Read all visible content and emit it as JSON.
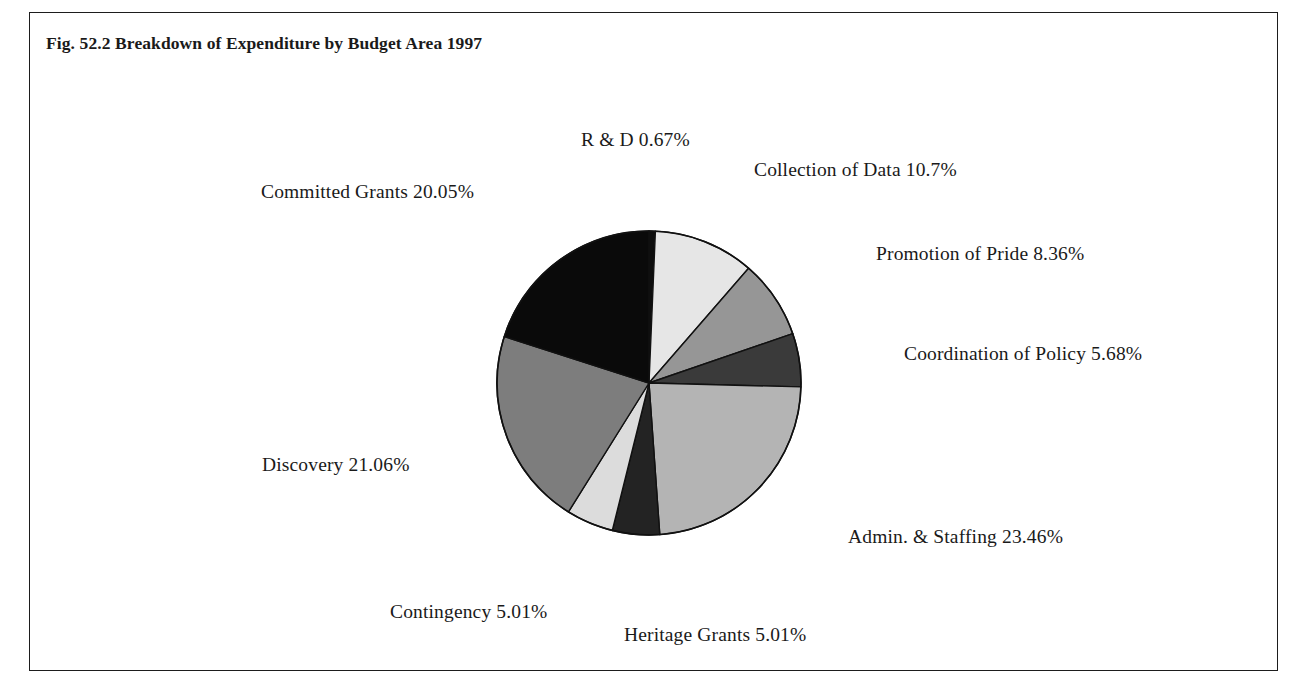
{
  "figure": {
    "title": "Fig. 52.2 Breakdown of Expenditure by Budget Area 1997"
  },
  "chart_data": {
    "type": "pie",
    "title": "Fig. 52.2 Breakdown of Expenditure by Budget Area 1997",
    "xlabel": "",
    "ylabel": "",
    "units": "percent",
    "start_angle_deg": 0,
    "direction": "clockwise",
    "legend": "none (direct slice labels)",
    "grid": false,
    "categories": [
      "R & D",
      "Collection of Data",
      "Promotion of Pride",
      "Coordination of Policy",
      "Admin. & Staffing",
      "Heritage Grants",
      "Contingency",
      "Discovery",
      "Committed Grants"
    ],
    "values": [
      0.67,
      10.7,
      8.36,
      5.68,
      23.46,
      5.01,
      5.01,
      21.06,
      20.05
    ],
    "colors": [
      "#0d0d0d",
      "#e6e6e6",
      "#969696",
      "#3a3a3a",
      "#b4b4b4",
      "#232323",
      "#dcdcdc",
      "#7d7d7d",
      "#0a0a0a"
    ],
    "slices": [
      {
        "label": "R & D",
        "value": 0.67,
        "text": "R & D 0.67%",
        "color": "#0d0d0d"
      },
      {
        "label": "Collection of Data",
        "value": 10.7,
        "text": "Collection of Data 10.7%",
        "color": "#e6e6e6"
      },
      {
        "label": "Promotion of Pride",
        "value": 8.36,
        "text": "Promotion of Pride 8.36%",
        "color": "#969696"
      },
      {
        "label": "Coordination of Policy",
        "value": 5.68,
        "text": "Coordination of Policy 5.68%",
        "color": "#3a3a3a"
      },
      {
        "label": "Admin. & Staffing",
        "value": 23.46,
        "text": "Admin. & Staffing 23.46%",
        "color": "#b4b4b4"
      },
      {
        "label": "Heritage Grants",
        "value": 5.01,
        "text": "Heritage Grants 5.01%",
        "color": "#232323"
      },
      {
        "label": "Contingency",
        "value": 5.01,
        "text": "Contingency 5.01%",
        "color": "#dcdcdc"
      },
      {
        "label": "Discovery",
        "value": 21.06,
        "text": "Discovery 21.06%",
        "color": "#7d7d7d"
      },
      {
        "label": "Committed Grants",
        "value": 20.05,
        "text": "Committed Grants 20.05%",
        "color": "#0a0a0a"
      }
    ]
  },
  "labels": {
    "rd": "R & D 0.67%",
    "collection": "Collection of Data 10.7%",
    "promotion": "Promotion of Pride 8.36%",
    "coordination": "Coordination of Policy 5.68%",
    "admin": "Admin. & Staffing 23.46%",
    "heritage": "Heritage Grants 5.01%",
    "contingency": "Contingency 5.01%",
    "discovery": "Discovery 21.06%",
    "committed": "Committed Grants 20.05%"
  },
  "style": {
    "border_color": "#1d1d1d",
    "background": "#ffffff",
    "text_color": "#1a1a1a",
    "slice_outline": "#111111"
  },
  "geometry": {
    "center_x": 648,
    "center_y": 382,
    "radius": 152
  }
}
